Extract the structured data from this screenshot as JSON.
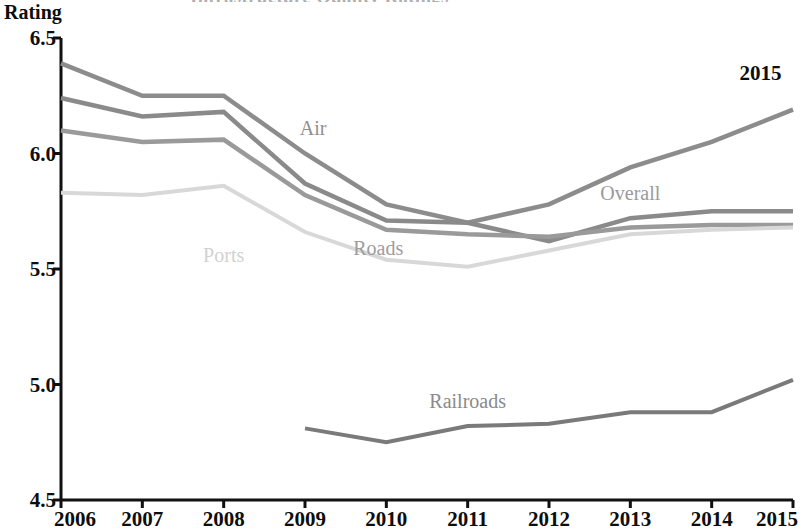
{
  "title_partial": "Infrastructure Quality Ratings",
  "axis": {
    "y_label": "Rating",
    "y_ticks": [
      "6.5",
      "6.0",
      "5.5",
      "5.0",
      "4.5"
    ],
    "x_ticks": [
      "2006",
      "2007",
      "2008",
      "2009",
      "2010",
      "2011",
      "2012",
      "2013",
      "2014",
      "2015"
    ]
  },
  "annotations": {
    "air": "Air",
    "ports": "Ports",
    "roads": "Roads",
    "overall": "Overall",
    "railroads": "Railroads",
    "year_marker": "2015"
  },
  "colors": {
    "air": "#8c8c8c",
    "roads": "#8a8a8a",
    "overall": "#9a9a9a",
    "ports": "#d8d8d8",
    "railroads": "#7a7a7a",
    "axis": "#111111",
    "text": "#0d0d0d"
  },
  "chart_data": {
    "type": "line",
    "title": "Infrastructure Quality Ratings",
    "xlabel": "",
    "ylabel": "Rating",
    "x": [
      2006,
      2007,
      2008,
      2009,
      2010,
      2011,
      2012,
      2013,
      2014,
      2015
    ],
    "xlim": [
      2006,
      2015
    ],
    "ylim": [
      4.5,
      6.5
    ],
    "ytick_values": [
      6.5,
      6.0,
      5.5,
      5.0,
      4.5
    ],
    "grid": false,
    "legend": "inline-labels",
    "series": [
      {
        "name": "Air",
        "color": "#8c8c8c",
        "x": [
          2006,
          2007,
          2008,
          2009,
          2010,
          2011,
          2012,
          2013,
          2014,
          2015
        ],
        "values": [
          6.39,
          6.25,
          6.25,
          6.0,
          5.78,
          5.7,
          5.78,
          5.94,
          6.05,
          6.19
        ]
      },
      {
        "name": "Roads",
        "color": "#8a8a8a",
        "x": [
          2006,
          2007,
          2008,
          2009,
          2010,
          2011,
          2012,
          2013,
          2014,
          2015
        ],
        "values": [
          6.24,
          6.16,
          6.18,
          5.87,
          5.71,
          5.7,
          5.62,
          5.72,
          5.75,
          5.75
        ]
      },
      {
        "name": "Overall",
        "color": "#9a9a9a",
        "x": [
          2006,
          2007,
          2008,
          2009,
          2010,
          2011,
          2012,
          2013,
          2014,
          2015
        ],
        "values": [
          6.1,
          6.05,
          6.06,
          5.82,
          5.67,
          5.65,
          5.64,
          5.68,
          5.69,
          5.69
        ]
      },
      {
        "name": "Ports",
        "color": "#d8d8d8",
        "x": [
          2006,
          2007,
          2008,
          2009,
          2010,
          2011,
          2012,
          2013,
          2014,
          2015
        ],
        "values": [
          5.83,
          5.82,
          5.86,
          5.66,
          5.54,
          5.51,
          5.58,
          5.65,
          5.67,
          5.68
        ]
      },
      {
        "name": "Railroads",
        "color": "#7a7a7a",
        "x": [
          2009,
          2010,
          2011,
          2012,
          2013,
          2014,
          2015
        ],
        "values": [
          4.81,
          4.75,
          4.82,
          4.83,
          4.88,
          4.88,
          5.02
        ]
      }
    ],
    "annotations": [
      {
        "text": "Air",
        "x": 2009.1,
        "y": 6.11
      },
      {
        "text": "Ports",
        "x": 2008.0,
        "y": 5.56
      },
      {
        "text": "Roads",
        "x": 2009.9,
        "y": 5.59
      },
      {
        "text": "Overall",
        "x": 2013.0,
        "y": 5.83
      },
      {
        "text": "Railroads",
        "x": 2011.0,
        "y": 4.93
      },
      {
        "text": "2015",
        "x": 2014.6,
        "y": 6.35
      }
    ]
  }
}
